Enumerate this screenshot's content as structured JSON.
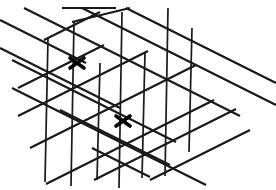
{
  "figure": {
    "background_color": "#ffffff",
    "line_color": "#1a1a1a",
    "marker_color": "#000000",
    "width": 276,
    "height": 190
  },
  "lattice": {
    "families": [
      {
        "name": "vertical",
        "description": "near-vertical lines, slight lean",
        "slope": null,
        "stroke_width": 1.7,
        "count": 7
      },
      {
        "name": "down-right",
        "description": "diagonals descending to the right",
        "slope": 0.5,
        "stroke_width": 2.1,
        "count": 9
      },
      {
        "name": "up-right",
        "description": "diagonals ascending to the right",
        "slope": -0.5,
        "stroke_width": 2.1,
        "count": 9
      }
    ],
    "vertical_lines": [
      {
        "x1": 48,
        "y1": 38,
        "x2": 45,
        "y2": 182
      },
      {
        "x1": 74,
        "y1": 22,
        "x2": 71,
        "y2": 186
      },
      {
        "x1": 100,
        "y1": 63,
        "x2": 97,
        "y2": 180
      },
      {
        "x1": 122,
        "y1": 12,
        "x2": 119,
        "y2": 188
      },
      {
        "x1": 145,
        "y1": 52,
        "x2": 142,
        "y2": 178
      },
      {
        "x1": 168,
        "y1": 8,
        "x2": 165,
        "y2": 176
      },
      {
        "x1": 192,
        "y1": 28,
        "x2": 189,
        "y2": 152
      }
    ],
    "down_right_lines": [
      {
        "x1": 0,
        "y1": 20,
        "x2": 86,
        "y2": 63
      },
      {
        "x1": 0,
        "y1": 48,
        "x2": 120,
        "y2": 108
      },
      {
        "x1": 12,
        "y1": 60,
        "x2": 176,
        "y2": 142
      },
      {
        "x1": 12,
        "y1": 88,
        "x2": 206,
        "y2": 185
      },
      {
        "x1": 24,
        "y1": 8,
        "x2": 240,
        "y2": 116
      },
      {
        "x1": 82,
        "y1": 8,
        "x2": 276,
        "y2": 105
      },
      {
        "x1": 126,
        "y1": 8,
        "x2": 276,
        "y2": 83
      },
      {
        "x1": 60,
        "y1": 110,
        "x2": 170,
        "y2": 165
      },
      {
        "x1": 92,
        "y1": 148,
        "x2": 150,
        "y2": 177
      }
    ],
    "up_right_lines": [
      {
        "x1": 18,
        "y1": 88,
        "x2": 104,
        "y2": 45
      },
      {
        "x1": 18,
        "y1": 116,
        "x2": 148,
        "y2": 51
      },
      {
        "x1": 30,
        "y1": 148,
        "x2": 196,
        "y2": 65
      },
      {
        "x1": 46,
        "y1": 184,
        "x2": 214,
        "y2": 100
      },
      {
        "x1": 62,
        "y1": 8,
        "x2": 116,
        "y2": 8
      },
      {
        "x1": 72,
        "y1": 22,
        "x2": 130,
        "y2": 8
      },
      {
        "x1": 94,
        "y1": 180,
        "x2": 236,
        "y2": 109
      },
      {
        "x1": 150,
        "y1": 180,
        "x2": 250,
        "y2": 130
      },
      {
        "x1": 44,
        "y1": 40,
        "x2": 100,
        "y2": 12
      }
    ],
    "markers": [
      {
        "label": "marker-1",
        "x": 77,
        "y": 63,
        "size": 7
      },
      {
        "label": "marker-2",
        "x": 123,
        "y": 121,
        "size": 7
      }
    ]
  }
}
